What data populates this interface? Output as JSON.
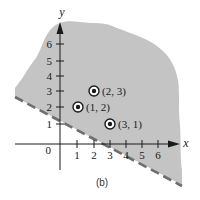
{
  "figure": {
    "caption": "(b)",
    "x_axis_label": "x",
    "y_axis_label": "y",
    "origin_label": "0",
    "x_ticks": [
      "1",
      "2",
      "3",
      "4",
      "5",
      "6"
    ],
    "y_ticks": [
      "1",
      "2",
      "3",
      "4",
      "5",
      "6"
    ],
    "points": [
      {
        "label": "(1, 2)",
        "x": 1,
        "y": 2
      },
      {
        "label": "(2, 3)",
        "x": 2,
        "y": 3
      },
      {
        "label": "(3, 1)",
        "x": 3,
        "y": 1
      }
    ],
    "boundary_line": {
      "style": "dashed",
      "description": "x + 2y = 4 (boundary not included)",
      "color": "#7a7a7a"
    },
    "shaded_region": {
      "description": "half-plane above the dashed line",
      "color": "#c4c4c4"
    }
  }
}
